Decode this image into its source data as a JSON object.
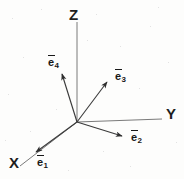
{
  "figure": {
    "type": "vector-diagram",
    "background_color": "#fdfdfc",
    "line_color": "#5a5a5a",
    "vector_color": "#3a3a3a",
    "text_color": "#181818"
  },
  "axes": [
    {
      "id": "x",
      "label": "X",
      "label_x": 9,
      "label_y": 155,
      "from": [
        77,
        122
      ],
      "to": [
        20,
        166
      ]
    },
    {
      "id": "y",
      "label": "Y",
      "label_x": 166,
      "label_y": 106,
      "from": [
        77,
        122
      ],
      "to": [
        162,
        119
      ]
    },
    {
      "id": "z",
      "label": "Z",
      "label_x": 69,
      "label_y": 7,
      "from": [
        77,
        122
      ],
      "to": [
        77,
        22
      ]
    }
  ],
  "vectors": [
    {
      "id": "e1",
      "base": "e",
      "subscript": "1",
      "overbar": true,
      "from": [
        77,
        122
      ],
      "to": [
        34,
        153
      ],
      "label_x": 37,
      "label_y": 157
    },
    {
      "id": "e2",
      "base": "e",
      "subscript": "2",
      "overbar": true,
      "from": [
        77,
        122
      ],
      "to": [
        126,
        138
      ],
      "label_x": 131,
      "label_y": 132
    },
    {
      "id": "e3",
      "base": "e",
      "subscript": "3",
      "overbar": true,
      "from": [
        77,
        122
      ],
      "to": [
        110,
        79
      ],
      "label_x": 115,
      "label_y": 71
    },
    {
      "id": "e4",
      "base": "e",
      "subscript": "4",
      "overbar": true,
      "from": [
        77,
        122
      ],
      "to": [
        61,
        70
      ],
      "label_x": 48,
      "label_y": 57
    }
  ],
  "origin": {
    "x": 77,
    "y": 122
  }
}
